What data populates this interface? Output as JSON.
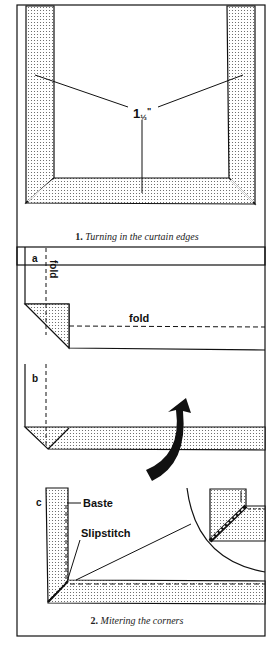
{
  "figure1": {
    "measurement_label": "1½\"",
    "measurement_main": "1",
    "measurement_frac": "½",
    "measurement_mark": "\"",
    "caption_number": "1.",
    "caption_text": "Turning in the curtain edges"
  },
  "figure2": {
    "panel_a": {
      "letter": "a",
      "fold_vertical": "fold",
      "fold_horizontal": "fold"
    },
    "panel_b": {
      "letter": "b"
    },
    "panel_c": {
      "letter": "c",
      "baste_label": "Baste",
      "slipstitch_label": "Slipstitch"
    },
    "caption_number": "2.",
    "caption_text": "Mitering the corners"
  },
  "colors": {
    "ink": "#111111",
    "paper": "#ffffff",
    "dots": "#555555"
  }
}
